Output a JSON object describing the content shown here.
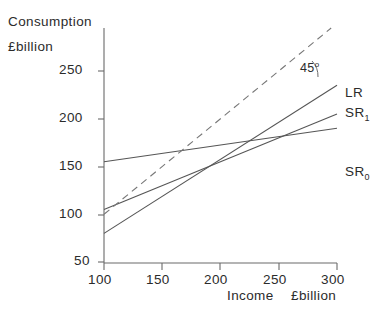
{
  "chart_data": {
    "type": "line",
    "title": "",
    "ylabel": "Consumption £billion",
    "xlabel": "Income   £billion",
    "ylabel_line1": "Consumption",
    "ylabel_line2": "£billion",
    "xlabel_part1": "Income",
    "xlabel_part2": "£billion",
    "xlim": [
      100,
      300
    ],
    "ylim": [
      50,
      275
    ],
    "xticks": [
      100,
      150,
      200,
      250,
      300
    ],
    "xtick_labels": [
      "100",
      "150",
      "200",
      "250",
      "300"
    ],
    "yticks": [
      50,
      100,
      150,
      200,
      250
    ],
    "ytick_labels": [
      "50",
      "100",
      "150",
      "200",
      "250"
    ],
    "grid": false,
    "legend": "inline-right",
    "annotations": [
      {
        "name": "angle-45",
        "text": "45",
        "superscript": "o",
        "x": 268,
        "y": 250
      }
    ],
    "series": [
      {
        "name": "SR0",
        "label_main": "SR",
        "label_sub": "0",
        "style": "solid",
        "color": "#555555",
        "points": [
          [
            100,
            155
          ],
          [
            300,
            190
          ]
        ],
        "label_pos": [
          305,
          190
        ]
      },
      {
        "name": "SR1",
        "label_main": "SR",
        "label_sub": "1",
        "style": "solid",
        "color": "#555555",
        "points": [
          [
            100,
            105
          ],
          [
            300,
            205
          ]
        ],
        "label_pos": [
          305,
          205
        ]
      },
      {
        "name": "LR",
        "label_main": "LR",
        "label_sub": "",
        "style": "solid",
        "color": "#555555",
        "points": [
          [
            100,
            80
          ],
          [
            300,
            235
          ]
        ],
        "label_pos": [
          305,
          235
        ]
      },
      {
        "name": "forty-five-degree-line",
        "label_main": "",
        "label_sub": "",
        "style": "dashed",
        "color": "#777777",
        "points": [
          [
            100,
            100
          ],
          [
            295,
            295
          ]
        ],
        "label_pos": [
          0,
          0
        ]
      }
    ]
  },
  "axes": {
    "y_axis_name": "consumption-axis",
    "x_axis_name": "income-axis"
  }
}
